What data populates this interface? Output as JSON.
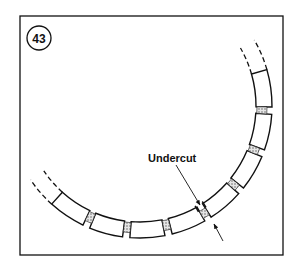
{
  "figure": {
    "number": "43",
    "label": "Undercut",
    "frame": {
      "x": 20,
      "y": 16,
      "w": 263,
      "h": 239
    },
    "ring": {
      "center": [
        140,
        106
      ],
      "inner_r": 116,
      "outer_r": 132,
      "start_deg": -16,
      "end_deg": 132,
      "gap_angles_deg": [
        2,
        21,
        40,
        59,
        77.5,
        96,
        114
      ],
      "gap_width_deg": 3.2,
      "undercut_index": 3,
      "dash_ext_deg": 14
    },
    "colors": {
      "line": "#111111",
      "mica": "#bdbdbd",
      "bg": "#ffffff"
    }
  }
}
